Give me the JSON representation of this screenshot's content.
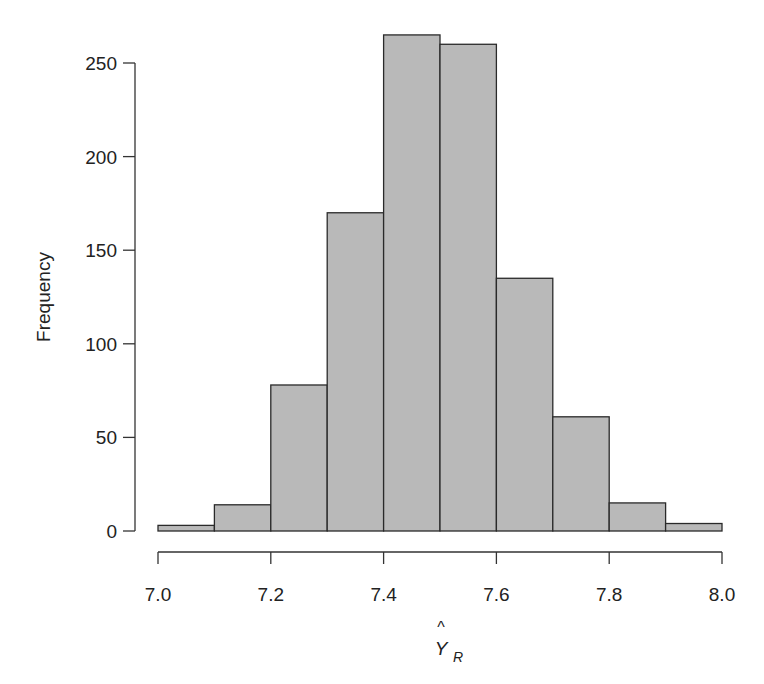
{
  "chart_data": {
    "type": "bar",
    "subtype": "histogram",
    "title": "",
    "xlabel": "Ŷ_R",
    "xlabel_main": "Y",
    "xlabel_hat": "^",
    "xlabel_sub": "R",
    "ylabel": "Frequency",
    "bin_edges": [
      7.0,
      7.1,
      7.2,
      7.3,
      7.4,
      7.5,
      7.6,
      7.7,
      7.8,
      7.9,
      8.0
    ],
    "categories": [
      "7.0-7.1",
      "7.1-7.2",
      "7.2-7.3",
      "7.3-7.4",
      "7.4-7.5",
      "7.5-7.6",
      "7.6-7.7",
      "7.7-7.8",
      "7.8-7.9",
      "7.9-8.0"
    ],
    "values": [
      3,
      14,
      78,
      170,
      265,
      260,
      135,
      61,
      15,
      4
    ],
    "xlim": [
      7.0,
      8.0
    ],
    "ylim": [
      0,
      250
    ],
    "x_ticks": [
      "7.0",
      "7.2",
      "7.4",
      "7.6",
      "7.8",
      "8.0"
    ],
    "x_tick_values": [
      7.0,
      7.2,
      7.4,
      7.6,
      7.8,
      8.0
    ],
    "y_ticks": [
      "0",
      "50",
      "100",
      "150",
      "200",
      "250"
    ],
    "y_tick_values": [
      0,
      50,
      100,
      150,
      200,
      250
    ],
    "grid": false,
    "legend": null,
    "colors": {
      "bar_fill": "#b9b9b9",
      "bar_stroke": "#2a2a2a",
      "axis": "#333333",
      "text": "#222222"
    }
  }
}
